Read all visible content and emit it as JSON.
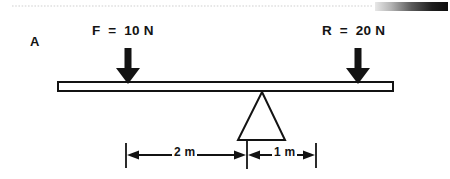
{
  "figure": {
    "panel_label": "A",
    "background_color": "#ffffff",
    "ink_color": "#131313",
    "width": 450,
    "height": 179
  },
  "decorations": {
    "top_rule": {
      "name": "dotted-rule",
      "color": "#cfcfcf",
      "y": 6,
      "x_start": 12,
      "x_end": 372
    },
    "gradient_bar": {
      "name": "gradient-bar",
      "from_color": "#e2e2e2",
      "to_color": "#0d0d0d",
      "x": 375,
      "y": 2,
      "width": 73,
      "height": 9
    }
  },
  "beam": {
    "name": "lever-beam",
    "x": 58,
    "y": 82,
    "width": 335,
    "height": 9,
    "stroke_color": "#131313",
    "fill_color": "#ffffff",
    "stroke_width": 2
  },
  "fulcrum": {
    "name": "fulcrum-triangle",
    "apex_x": 262,
    "apex_y": 92,
    "base_left_x": 238,
    "base_right_x": 285,
    "base_y": 140,
    "stroke_color": "#131313",
    "fill_color": "#ffffff",
    "stroke_width": 2
  },
  "forces": [
    {
      "id": "force-left",
      "label": "F  =  10 N",
      "symbol": "F",
      "value": 10,
      "unit": "N",
      "direction": "down",
      "arrow_x": 128,
      "arrow_top_y": 48,
      "arrow_tip_y": 83,
      "color": "#131313"
    },
    {
      "id": "force-right",
      "label": "R  =  20 N",
      "symbol": "R",
      "value": 20,
      "unit": "N",
      "direction": "down",
      "arrow_x": 358,
      "arrow_top_y": 48,
      "arrow_tip_y": 83,
      "color": "#131313"
    }
  ],
  "dimensions": {
    "line_y": 155,
    "tick_top_y": 143,
    "tick_bottom_y": 169,
    "items": [
      {
        "id": "dim-left",
        "label": "2 m",
        "value": 2,
        "unit": "m",
        "from_x": 126,
        "to_x": 247
      },
      {
        "id": "dim-right",
        "label": "1 m",
        "value": 1,
        "unit": "m",
        "from_x": 247,
        "to_x": 316
      }
    ]
  }
}
